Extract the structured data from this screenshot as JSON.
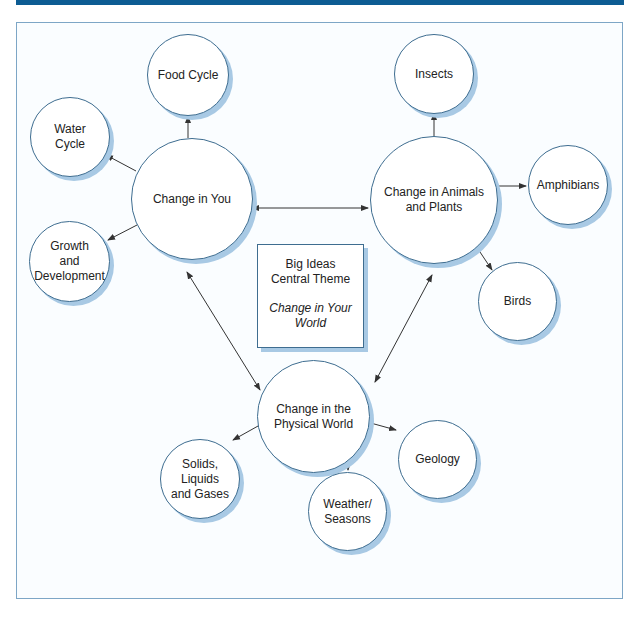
{
  "central_theme": {
    "line1": "Big Ideas",
    "line2": "Central Theme",
    "italic1": "Change in Your",
    "italic2": "World"
  },
  "hubs": [
    {
      "id": "change-in-you",
      "label": "Change in You"
    },
    {
      "id": "change-in-animals-plants",
      "label_line1": "Change in Animals",
      "label_line2": "and Plants"
    },
    {
      "id": "change-physical-world",
      "label_line1": "Change in the",
      "label_line2": "Physical World"
    }
  ],
  "leaves": {
    "change-in-you": [
      {
        "label": "Food Cycle"
      },
      {
        "line1": "Water",
        "line2": "Cycle"
      },
      {
        "line1": "Growth",
        "line2": "and",
        "line3": "Development"
      }
    ],
    "change-in-animals-plants": [
      {
        "label": "Insects"
      },
      {
        "label": "Amphibians"
      },
      {
        "label": "Birds"
      }
    ],
    "change-physical-world": [
      {
        "line1": "Solids,",
        "line2": "Liquids",
        "line3": "and Gases"
      },
      {
        "line1": "Weather/",
        "line2": "Seasons"
      },
      {
        "label": "Geology"
      }
    ]
  },
  "colors": {
    "header_bar": "#0d5c93",
    "circle_stroke": "#3e6d90",
    "circle_shadow": "#a8c9e4",
    "frame_border": "#7da6c6"
  }
}
